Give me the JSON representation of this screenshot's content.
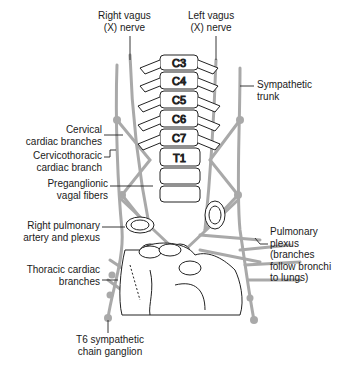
{
  "diagram": {
    "vertebrae": [
      "C3",
      "C4",
      "C5",
      "C6",
      "C7",
      "T1"
    ],
    "labels": {
      "right_vagus": "Right vagus\n(X) nerve",
      "left_vagus": "Left vagus\n(X) nerve",
      "sympathetic_trunk": "Sympathetic\ntrunk",
      "cervical_cardiac": "Cervical\ncardiac branches",
      "cervicothoracic": "Cervicothoracic\ncardiac branch",
      "preganglionic": "Preganglionic\nvagal fibers",
      "right_pulmonary": "Right pulmonary\nartery and plexus",
      "pulmonary_plexus": "Pulmonary\nplexus\n(branches\nfollow bronchi\nto lungs)",
      "thoracic_cardiac": "Thoracic cardiac\nbranches",
      "t6_ganglion": "T6 sympathetic\nchain ganglion"
    },
    "colors": {
      "nerve": "#a8a8a8",
      "outline": "#222222",
      "leader": "#222222"
    }
  }
}
